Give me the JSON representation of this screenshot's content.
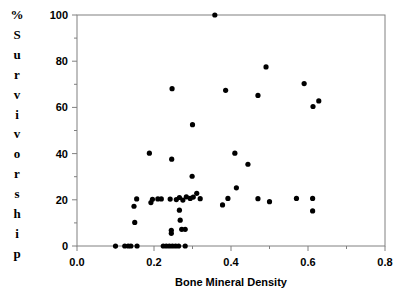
{
  "chart_data": {
    "type": "scatter",
    "title": "",
    "xlabel": "Bone Mineral Density",
    "ylabel": "% Survivorship",
    "xlim": [
      0.0,
      0.8
    ],
    "ylim": [
      0,
      100
    ],
    "xticks": [
      0.0,
      0.2,
      0.4,
      0.6,
      0.8
    ],
    "xtick_labels": [
      "0.0",
      "0.2",
      "0.4",
      "0.6",
      "0.8"
    ],
    "yticks": [
      0,
      20,
      40,
      60,
      80,
      100
    ],
    "ytick_labels": [
      "0",
      "20",
      "40",
      "60",
      "80",
      "100"
    ],
    "minor_xticks": [
      0.1,
      0.3,
      0.5,
      0.7
    ],
    "minor_yticks": [
      10,
      30,
      50,
      70,
      90
    ],
    "grid": false,
    "legend": null,
    "marker": {
      "shape": "circle",
      "color": "#000000",
      "size_px": 5.2
    },
    "points": [
      {
        "x": 0.1,
        "y": 0
      },
      {
        "x": 0.124,
        "y": 0
      },
      {
        "x": 0.133,
        "y": 0
      },
      {
        "x": 0.14,
        "y": 0
      },
      {
        "x": 0.156,
        "y": 0
      },
      {
        "x": 0.224,
        "y": 0
      },
      {
        "x": 0.232,
        "y": 0
      },
      {
        "x": 0.24,
        "y": 0
      },
      {
        "x": 0.248,
        "y": 0
      },
      {
        "x": 0.256,
        "y": 0
      },
      {
        "x": 0.264,
        "y": 0
      },
      {
        "x": 0.281,
        "y": 0
      },
      {
        "x": 0.245,
        "y": 5.5
      },
      {
        "x": 0.245,
        "y": 6.8
      },
      {
        "x": 0.272,
        "y": 7.2
      },
      {
        "x": 0.281,
        "y": 7.2
      },
      {
        "x": 0.15,
        "y": 10.2
      },
      {
        "x": 0.268,
        "y": 11.2
      },
      {
        "x": 0.612,
        "y": 15.2
      },
      {
        "x": 0.266,
        "y": 15.5
      },
      {
        "x": 0.148,
        "y": 17.2
      },
      {
        "x": 0.378,
        "y": 17.8
      },
      {
        "x": 0.192,
        "y": 18.8
      },
      {
        "x": 0.155,
        "y": 20.4
      },
      {
        "x": 0.196,
        "y": 20.2
      },
      {
        "x": 0.21,
        "y": 20.4
      },
      {
        "x": 0.219,
        "y": 20.4
      },
      {
        "x": 0.242,
        "y": 20.3
      },
      {
        "x": 0.258,
        "y": 20.1
      },
      {
        "x": 0.266,
        "y": 21.0
      },
      {
        "x": 0.275,
        "y": 19.9
      },
      {
        "x": 0.284,
        "y": 21.3
      },
      {
        "x": 0.294,
        "y": 20.6
      },
      {
        "x": 0.302,
        "y": 21.2
      },
      {
        "x": 0.311,
        "y": 22.8
      },
      {
        "x": 0.32,
        "y": 20.5
      },
      {
        "x": 0.392,
        "y": 20.6
      },
      {
        "x": 0.47,
        "y": 20.5
      },
      {
        "x": 0.5,
        "y": 19.2
      },
      {
        "x": 0.57,
        "y": 20.6
      },
      {
        "x": 0.612,
        "y": 20.6
      },
      {
        "x": 0.414,
        "y": 25.2
      },
      {
        "x": 0.299,
        "y": 30.2
      },
      {
        "x": 0.444,
        "y": 35.4
      },
      {
        "x": 0.246,
        "y": 37.6
      },
      {
        "x": 0.188,
        "y": 40.2
      },
      {
        "x": 0.41,
        "y": 40.2
      },
      {
        "x": 0.3,
        "y": 52.5
      },
      {
        "x": 0.613,
        "y": 60.4
      },
      {
        "x": 0.628,
        "y": 62.8
      },
      {
        "x": 0.47,
        "y": 65.2
      },
      {
        "x": 0.247,
        "y": 68.1
      },
      {
        "x": 0.386,
        "y": 67.4
      },
      {
        "x": 0.59,
        "y": 70.3
      },
      {
        "x": 0.491,
        "y": 77.5
      },
      {
        "x": 0.358,
        "y": 100.0
      }
    ]
  },
  "ylabel_chars": [
    "%",
    "S",
    "u",
    "r",
    "v",
    "i",
    "v",
    "o",
    "r",
    "s",
    "h",
    "i",
    "p"
  ],
  "axis": {
    "frame_color": "#808080",
    "text_color": "#000000"
  }
}
